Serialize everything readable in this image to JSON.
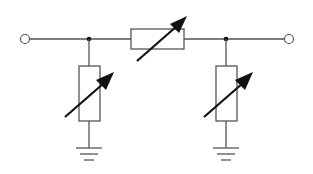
{
  "diagram": {
    "type": "circuit-schematic",
    "colors": {
      "wire": "#555555",
      "arrow": "#111111",
      "background": "#ffffff"
    },
    "terminals": [
      {
        "id": "input-terminal",
        "x": 25,
        "y": 39
      },
      {
        "id": "output-terminal",
        "x": 289,
        "y": 39
      }
    ],
    "nodes": [
      {
        "id": "node-left",
        "x": 89,
        "y": 39
      },
      {
        "id": "node-right",
        "x": 226,
        "y": 39
      }
    ],
    "components": [
      {
        "id": "series-variable-resistor",
        "kind": "variable-resistor",
        "orientation": "horizontal",
        "between": [
          "node-left",
          "node-right"
        ]
      },
      {
        "id": "left-shunt-variable-resistor",
        "kind": "variable-resistor",
        "orientation": "vertical",
        "between": [
          "node-left",
          "ground-left"
        ]
      },
      {
        "id": "right-shunt-variable-resistor",
        "kind": "variable-resistor",
        "orientation": "vertical",
        "between": [
          "node-right",
          "ground-right"
        ]
      }
    ],
    "grounds": [
      {
        "id": "ground-left",
        "x": 89,
        "y": 148
      },
      {
        "id": "ground-right",
        "x": 226,
        "y": 148
      }
    ]
  }
}
